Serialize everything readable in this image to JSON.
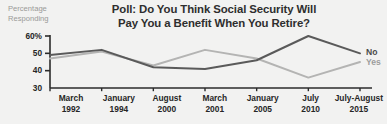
{
  "title": {
    "line1": "Poll: Do You Think Social Security Will",
    "line2": "Pay You a Benefit When You Retire?"
  },
  "y_caption": {
    "line1": "Percentage",
    "line2": "Responding"
  },
  "legend": {
    "no_label": "No",
    "yes_label": "Yes"
  },
  "colors": {
    "background": "#f2f2f1",
    "axis": "#2b2b2b",
    "no_line": "#5a5a5a",
    "yes_line": "#b4b4b3",
    "title_text": "#2e2e2e",
    "caption_text": "#9a9a98",
    "tick_text": "#262626"
  },
  "chart_data": {
    "type": "line",
    "title": "Poll: Do You Think Social Security Will Pay You a Benefit When You Retire?",
    "xlabel": "",
    "ylabel": "Percentage Responding",
    "ylim": [
      30,
      60
    ],
    "yticks": [
      30,
      40,
      50,
      60
    ],
    "ytick_labels": [
      "30",
      "40",
      "50",
      "60%"
    ],
    "grid": false,
    "legend_position": "right-end-of-line",
    "categories": [
      "March 1992",
      "January 1994",
      "August 2000",
      "March 2001",
      "January 2005",
      "July 2010",
      "July-August 2015"
    ],
    "category_lines": [
      [
        "March",
        "1992"
      ],
      [
        "January",
        "1994"
      ],
      [
        "August",
        "2000"
      ],
      [
        "March",
        "2001"
      ],
      [
        "January",
        "2005"
      ],
      [
        "July",
        "2010"
      ],
      [
        "July-August",
        "2015"
      ]
    ],
    "series": [
      {
        "name": "No",
        "color": "#5a5a5a",
        "values": [
          49,
          52,
          42,
          41,
          46,
          60,
          50
        ]
      },
      {
        "name": "Yes",
        "color": "#b4b4b3",
        "values": [
          47,
          51,
          43,
          52,
          47,
          36,
          45
        ]
      }
    ]
  }
}
